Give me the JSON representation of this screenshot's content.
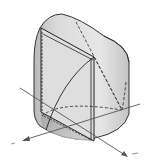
{
  "diagram": {
    "type": "3d-solid",
    "colors": {
      "background": "#ffffff",
      "surface_light": "#e8e8e8",
      "surface_mid": "#cfcfcf",
      "surface_dark": "#a8a8a8",
      "edge": "#222222",
      "axis": "#555555"
    },
    "axes": [
      {
        "name": "x-axis",
        "label": ""
      },
      {
        "name": "y-axis",
        "label": ""
      },
      {
        "name": "z-axis",
        "label": ""
      }
    ]
  }
}
